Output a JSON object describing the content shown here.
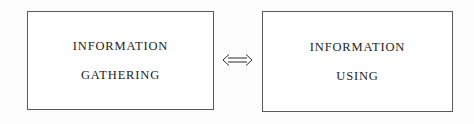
{
  "diagram": {
    "background_color": "#fdfdfd",
    "border_color": "#5a5a5a",
    "text_color": "#1c1c1c",
    "nodes": [
      {
        "id": "gathering",
        "line_1": "INFORMATION",
        "line_2": "GATHERING"
      },
      {
        "id": "using",
        "line_1": "INFORMATION",
        "line_2": "USING"
      }
    ],
    "connector": {
      "icon": "double-headed-arrow-icon",
      "glyph": "⟺",
      "direction": "bidirectional"
    }
  }
}
